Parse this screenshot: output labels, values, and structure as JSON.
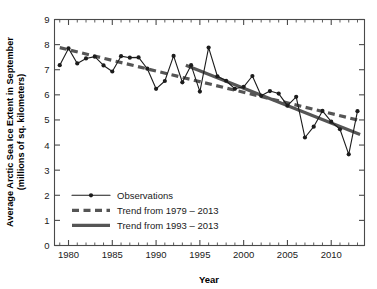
{
  "chart_data": {
    "type": "line",
    "title": "",
    "xlabel": "Year",
    "ylabel": "Average Arctic Sea Ice Extent in September (millions of sq. kilometers)",
    "ylabel_line1": "Average Arctic Sea Ice Extent in September",
    "ylabel_line2": "(millions of sq. kilometers)",
    "xlim": [
      1978.4,
      1913.6
    ],
    "xlim_actual": [
      1978.4,
      2013.8
    ],
    "ylim": [
      0,
      9
    ],
    "grid": false,
    "legend_position": "lower-left-inside",
    "x_ticks_major": [
      1980,
      1985,
      1990,
      1995,
      2000,
      2005,
      2010
    ],
    "x_tick_labels": [
      "1980",
      "1985",
      "1990",
      "1995",
      "2000",
      "2005",
      "2010"
    ],
    "x_tick_minor_step": 1,
    "y_ticks": [
      0,
      1,
      2,
      3,
      4,
      5,
      6,
      7,
      8,
      9
    ],
    "y_tick_labels": [
      "0",
      "1",
      "2",
      "3",
      "4",
      "5",
      "6",
      "7",
      "8",
      "9"
    ],
    "x": [
      1979,
      1980,
      1981,
      1982,
      1983,
      1984,
      1985,
      1986,
      1987,
      1988,
      1989,
      1990,
      1991,
      1992,
      1993,
      1994,
      1995,
      1996,
      1997,
      1998,
      1999,
      2000,
      2001,
      2002,
      2003,
      2004,
      2005,
      2006,
      2007,
      2008,
      2009,
      2010,
      2011,
      2012,
      2013
    ],
    "series": [
      {
        "name": "Observations",
        "style": "line-with-markers",
        "color": "#1c1c1c",
        "values": [
          7.18,
          7.85,
          7.25,
          7.45,
          7.52,
          7.17,
          6.93,
          7.54,
          7.48,
          7.49,
          7.04,
          6.24,
          6.55,
          7.55,
          6.5,
          7.18,
          6.13,
          7.88,
          6.74,
          6.56,
          6.24,
          6.32,
          6.75,
          5.96,
          6.15,
          6.05,
          5.57,
          5.92,
          4.3,
          4.73,
          5.36,
          4.93,
          4.63,
          3.63,
          5.35
        ]
      },
      {
        "name": "Trend from 1979 – 2013",
        "style": "dashed",
        "color": "#555555",
        "fit_endpoints": {
          "x": [
            1979,
            2013
          ],
          "y": [
            7.88,
            5.0
          ]
        }
      },
      {
        "name": "Trend from 1993 – 2013",
        "style": "solid-thick",
        "color": "#555555",
        "fit_endpoints": {
          "x": [
            1993.4,
            2013.3
          ],
          "y": [
            7.18,
            4.42
          ]
        }
      }
    ],
    "legend": [
      {
        "label": "Observations",
        "marker": "line-dot",
        "color": "#1c1c1c"
      },
      {
        "label": "Trend from 1979 – 2013",
        "marker": "dashed-line",
        "color": "#555555"
      },
      {
        "label": "Trend from 1993 – 2013",
        "marker": "thick-line",
        "color": "#555555"
      }
    ]
  },
  "colors": {
    "background": "#ffffff",
    "axis": "#4a4a4a",
    "observations": "#1c1c1c",
    "trend": "#555555",
    "text": "#000000"
  }
}
